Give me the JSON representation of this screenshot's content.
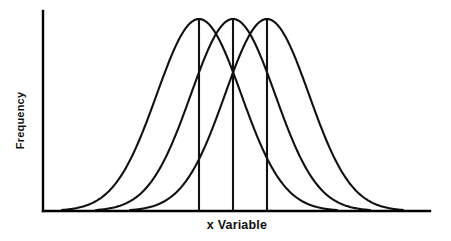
{
  "figure": {
    "background_color": "#ffffff",
    "line_color": "#111111",
    "width": 451,
    "height": 241
  },
  "axes": {
    "y_axis_label": "Frequency",
    "x_axis_label": "x Variable",
    "x_axis_origin_px": 43,
    "x_axis_end_px": 430,
    "y_axis_baseline_px": 211,
    "y_axis_top_px": 11
  },
  "chart_data": {
    "type": "line",
    "title": "",
    "subtitle": "",
    "xlabel": "x Variable",
    "ylabel": "Frequency",
    "xlim": [
      0,
      100
    ],
    "ylim": [
      0,
      1
    ],
    "grid": false,
    "legend": null,
    "legend_position": "none",
    "x_tick_labels": [],
    "y_tick_labels": [],
    "annotations": [
      "Three identically shaped normal (bell) curves with equal peak heights, shifted horizontally to different means",
      "A vertical line is drawn from each curve's peak down to the x-axis marking its mean"
    ],
    "series": [
      {
        "name": "Curve 1 (left distribution)",
        "mean": 40.3,
        "sigma": 8.5,
        "peak_height": 1.0,
        "peak_x_px": 199,
        "peak_y_px": 19,
        "left_base_x_px": 62,
        "right_base_x_px": 337,
        "vertical_line_from_peak": true
      },
      {
        "name": "Curve 2 (middle distribution)",
        "mean": 49.1,
        "sigma": 8.5,
        "peak_height": 1.0,
        "peak_x_px": 233,
        "peak_y_px": 19,
        "left_base_x_px": 96,
        "right_base_x_px": 370,
        "vertical_line_from_peak": true
      },
      {
        "name": "Curve 3 (right distribution)",
        "mean": 57.9,
        "sigma": 8.5,
        "peak_height": 1.0,
        "peak_x_px": 267,
        "peak_y_px": 19,
        "left_base_x_px": 130,
        "right_base_x_px": 403,
        "vertical_line_from_peak": true
      }
    ]
  }
}
